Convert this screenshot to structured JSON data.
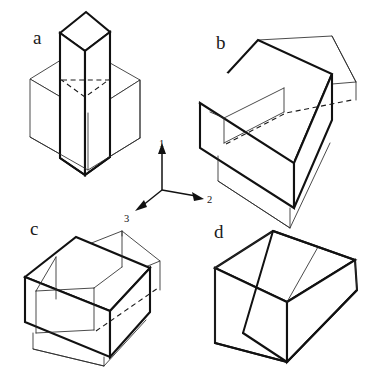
{
  "figure": {
    "background_color": "#ffffff",
    "bold_stroke_color": "#111111",
    "thin_stroke_color": "#2a2a2a",
    "dashed_stroke_color": "#1a1a1a",
    "width": 368,
    "height": 373
  },
  "labels": {
    "a": "a",
    "b": "b",
    "c": "c",
    "d": "d"
  },
  "axes": {
    "origin": {
      "x": 162,
      "y": 190
    },
    "items": [
      {
        "name": "axis-1",
        "label": "1",
        "direction": "up",
        "tip": {
          "x": 162,
          "y": 143
        },
        "label_pos": {
          "x": 159,
          "y": 144
        }
      },
      {
        "name": "axis-2",
        "label": "2",
        "direction": "right-down",
        "tip": {
          "x": 204,
          "y": 199
        },
        "label_pos": {
          "x": 208,
          "y": 203
        }
      },
      {
        "name": "axis-3",
        "label": "3",
        "direction": "left-down",
        "tip": {
          "x": 136,
          "y": 210
        },
        "label_pos": {
          "x": 127,
          "y": 220
        }
      }
    ]
  },
  "objects": [
    {
      "id": "a",
      "name": "object-a-tall-prism-through-slab",
      "description": "Bold tall vertical square prism penetrating a thin-line wide rectangular slab",
      "bold_part": "tall vertical prism",
      "thin_part": "wide horizontal slab",
      "hidden_edges": 1
    },
    {
      "id": "b",
      "name": "object-b-slab-with-raised-bar",
      "description": "Bold flat wide box with a thin-line bar slab sitting on and protruding from its top face",
      "bold_part": "flat wide base box",
      "thin_part": "raised bar slab",
      "hidden_edges": 1
    },
    {
      "id": "c",
      "name": "object-c-box-with-through-bar",
      "description": "Bold box with a thin-line horizontal bar passing through it left to right",
      "bold_part": "main box",
      "thin_part": "through bar",
      "hidden_edges": 1
    },
    {
      "id": "d",
      "name": "object-d-tapered-wedge-block",
      "description": "Bold block whose right portion tapers into a wedge, top face split into three strips",
      "bold_part": "tapered wedge block",
      "thin_part": "none",
      "hidden_edges": 0
    }
  ]
}
